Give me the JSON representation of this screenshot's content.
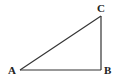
{
  "diagram": {
    "type": "right-triangle",
    "stroke_color": "#333333",
    "vertices": [
      {
        "id": "A",
        "label": "A",
        "x": 20,
        "y": 70
      },
      {
        "id": "B",
        "label": "B",
        "x": 101,
        "y": 70
      },
      {
        "id": "C",
        "label": "C",
        "x": 101,
        "y": 16
      }
    ],
    "edges": [
      {
        "from": "A",
        "to": "B"
      },
      {
        "from": "B",
        "to": "C"
      },
      {
        "from": "A",
        "to": "C"
      }
    ],
    "right_angle_at": "B"
  }
}
